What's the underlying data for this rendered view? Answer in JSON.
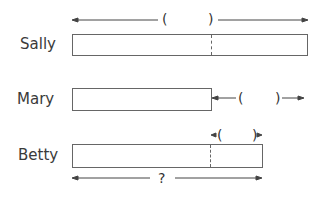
{
  "rows": [
    {
      "name": "Sally",
      "top_label": "(        )"
    },
    {
      "name": "Mary",
      "right_label": "(      )"
    },
    {
      "name": "Betty",
      "top_label": "(    )",
      "bottom_label": "?"
    }
  ],
  "labels": {
    "sally": "Sally",
    "mary": "Mary",
    "betty": "Betty",
    "paren_open": "(",
    "paren_close": ")",
    "question": "?"
  },
  "colors": {
    "line": "#555555",
    "text": "#333333"
  }
}
